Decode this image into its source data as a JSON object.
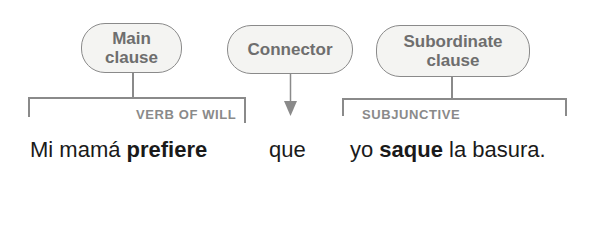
{
  "boxes": {
    "main": "Main clause",
    "main_line1": "Main",
    "main_line2": "clause",
    "connector": "Connector",
    "subordinate_line1": "Subordinate",
    "subordinate_line2": "clause"
  },
  "labels": {
    "verb_of_will": "VERB OF WILL",
    "subjunctive": "SUBJUNCTIVE"
  },
  "sentence": {
    "part1": "Mi mamá ",
    "verb1": "prefiere",
    "connector": "que",
    "part2": "yo ",
    "verb2": "saque",
    "part3": " la basura."
  },
  "colors": {
    "box_border": "#8a8a8a",
    "box_fill": "#f4f4f2",
    "box_text": "#6e6e6e",
    "label_text": "#8a8a8a",
    "sentence_text": "#1a1a1a"
  }
}
